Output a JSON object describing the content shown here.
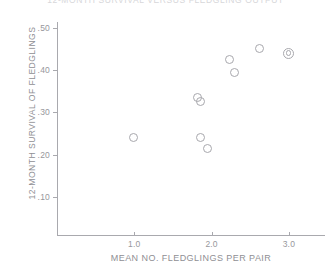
{
  "chart_data": {
    "type": "scatter",
    "title": "12-MONTH SURVIVAL VERSUS FLEDGLING OUTPUT",
    "xlabel": "MEAN NO. FLEDGLINGS PER PAIR",
    "ylabel": "12-MONTH SURVIVAL OF FLEDGLINGS",
    "xlim": [
      0.0,
      3.5
    ],
    "ylim": [
      0.0,
      0.55
    ],
    "grid": false,
    "legend": "none",
    "xticks": [
      {
        "value": 1.0,
        "label": "1.0"
      },
      {
        "value": 2.0,
        "label": "2.0"
      },
      {
        "value": 3.0,
        "label": "3.0"
      }
    ],
    "yticks": [
      {
        "value": 0.5,
        "label": ".50"
      },
      {
        "value": 0.4,
        "label": ".40"
      },
      {
        "value": 0.3,
        "label": ".30"
      },
      {
        "value": 0.2,
        "label": ".20"
      },
      {
        "value": 0.1,
        "label": ".10"
      }
    ],
    "marker_style": "open-circle",
    "points": [
      {
        "x": 0.99,
        "y": 0.24,
        "marker": "single"
      },
      {
        "x": 1.82,
        "y": 0.335,
        "marker": "single"
      },
      {
        "x": 1.86,
        "y": 0.325,
        "marker": "single"
      },
      {
        "x": 1.85,
        "y": 0.24,
        "marker": "single"
      },
      {
        "x": 1.94,
        "y": 0.215,
        "marker": "single"
      },
      {
        "x": 2.23,
        "y": 0.425,
        "marker": "single"
      },
      {
        "x": 2.3,
        "y": 0.395,
        "marker": "single"
      },
      {
        "x": 2.62,
        "y": 0.452,
        "marker": "single"
      },
      {
        "x": 3.0,
        "y": 0.44,
        "marker": "double"
      }
    ]
  },
  "axes": {
    "x_axis_name": "mean-fledglings-axis",
    "y_axis_name": "survival-axis"
  }
}
